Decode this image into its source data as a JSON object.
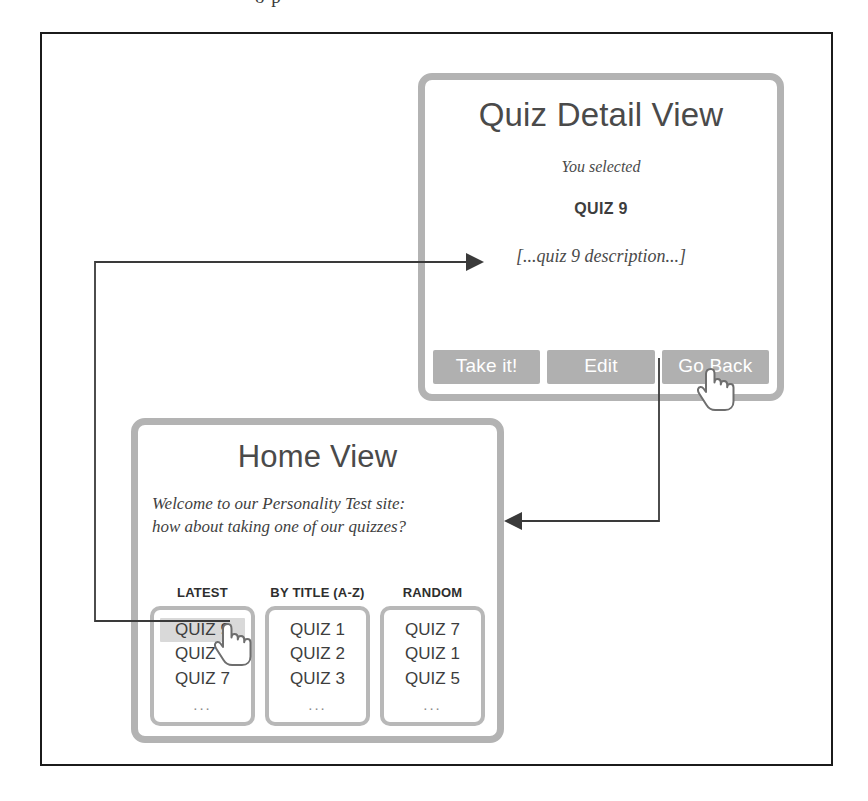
{
  "figure": {
    "caption_fragment": "o      p",
    "cursor_icon_name": "hand-pointer-cursor"
  },
  "detail_view": {
    "title": "Quiz Detail View",
    "subtitle": "You selected",
    "selected_quiz": "QUIZ 9",
    "description": "[...quiz 9 description...]",
    "buttons": [
      {
        "label": "Take it!",
        "name": "take-it-button"
      },
      {
        "label": "Edit",
        "name": "edit-button"
      },
      {
        "label": "Go Back",
        "name": "go-back-button"
      }
    ]
  },
  "home_view": {
    "title": "Home View",
    "welcome_line1": "Welcome to our Personality Test site:",
    "welcome_line2": "how about  taking one of our quizzes?",
    "columns": [
      {
        "header": "LATEST",
        "items": [
          "QUIZ 9",
          "QUIZ 8",
          "QUIZ 7",
          "..."
        ],
        "selected_index": 0
      },
      {
        "header": "BY TITLE (A-Z)",
        "items": [
          "QUIZ 1",
          "QUIZ 2",
          "QUIZ 3",
          "..."
        ],
        "selected_index": -1
      },
      {
        "header": "RANDOM",
        "items": [
          "QUIZ 7",
          "QUIZ 1",
          "QUIZ 5",
          "..."
        ],
        "selected_index": -1
      }
    ]
  },
  "arrows": [
    {
      "name": "arrow-home-to-detail",
      "direction": "right"
    },
    {
      "name": "arrow-detail-to-home",
      "direction": "left"
    }
  ],
  "colors": {
    "frame_border": "#1b1b1b",
    "window_border": "#b3b3b3",
    "button_fill": "#b0b0b0",
    "button_text": "#ffffff",
    "selected_item_bg": "#d9d9d9",
    "arrow_stroke": "#3a3a3a",
    "text_primary": "#3d3d3d"
  }
}
